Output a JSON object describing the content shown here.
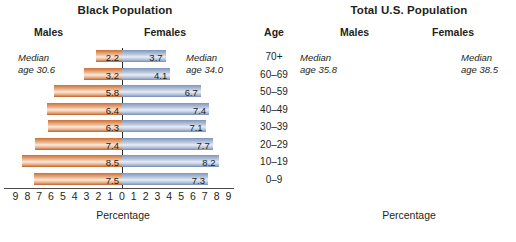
{
  "chart_data": {
    "type": "bar",
    "xlabel": "Percentage",
    "ylabel": "Age",
    "categories": [
      "70+",
      "60–69",
      "50–59",
      "40–49",
      "30–39",
      "20–29",
      "10–19",
      "0–9"
    ],
    "charts": [
      {
        "title": "Black Population",
        "xlabel": "Percentage",
        "xlim": [
          -9,
          9
        ],
        "xticks": [
          "9",
          "8",
          "7",
          "6",
          "5",
          "4",
          "3",
          "2",
          "1",
          "0",
          "1",
          "2",
          "3",
          "4",
          "5",
          "6",
          "7",
          "8",
          "9"
        ],
        "male_label": "Males",
        "female_label": "Females",
        "median_male": "30.6",
        "median_female": "34.0",
        "series": [
          {
            "name": "Males",
            "values": [
              2.2,
              3.2,
              5.8,
              6.4,
              6.3,
              7.4,
              8.5,
              7.5
            ]
          },
          {
            "name": "Females",
            "values": [
              3.7,
              4.1,
              6.7,
              7.4,
              7.1,
              7.7,
              8.2,
              7.3
            ]
          }
        ]
      },
      {
        "title": "Total U.S. Population",
        "xlabel": "Percentage",
        "xlim": [
          -8,
          8
        ],
        "xticks": [
          "8",
          "7",
          "6",
          "5",
          "4",
          "3",
          "2",
          "1",
          "0",
          "1",
          "2",
          "3",
          "4",
          "5",
          "6",
          "7",
          "8"
        ],
        "male_label": "Males",
        "female_label": "Females",
        "median_male": "35.8",
        "median_female": "38.5",
        "series": [
          {
            "name": "Males",
            "values": [
              2.7,
              4.5,
              6.6,
              7.0,
              6.5,
              7.0,
              7.1,
              6.7
            ]
          },
          {
            "name": "Females",
            "values": [
              5.3,
              4.9,
              6.9,
              7.1,
              6.5,
              6.8,
              6.7,
              6.4
            ]
          }
        ]
      }
    ],
    "colors": {
      "male": "#e08a52",
      "female": "#9fb2cf",
      "axis": "#2b2b2b",
      "text": "#231f20"
    },
    "grid": false,
    "legend": "none"
  },
  "black": {
    "title": "Black Population",
    "males_label": "Males",
    "females_label": "Females",
    "median_male_line1": "Median",
    "median_male_line2": "age 30.6",
    "median_female_line1": "Median",
    "median_female_line2": "age 34.0",
    "xcaption": "Percentage",
    "values_male": [
      "2.2",
      "3.2",
      "5.8",
      "6.4",
      "6.3",
      "7.4",
      "8.5",
      "7.5"
    ],
    "values_female": [
      "3.7",
      "4.1",
      "6.7",
      "7.4",
      "7.1",
      "7.7",
      "8.2",
      "7.3"
    ],
    "xticks": [
      "9",
      "8",
      "7",
      "6",
      "5",
      "4",
      "3",
      "2",
      "1",
      "0",
      "1",
      "2",
      "3",
      "4",
      "5",
      "6",
      "7",
      "8",
      "9"
    ]
  },
  "total": {
    "title": "Total U.S. Population",
    "males_label": "Males",
    "females_label": "Females",
    "median_male_line1": "Median",
    "median_male_line2": "age 35.8",
    "median_female_line1": "Median",
    "median_female_line2": "age 38.5",
    "xcaption": "Percentage",
    "values_male": [
      "2.7",
      "4.5",
      "6.6",
      "7.0",
      "6.5",
      "7.0",
      "7.1",
      "6.7"
    ],
    "values_female": [
      "5.3",
      "4.9",
      "6.9",
      "7.1",
      "6.5",
      "6.8",
      "6.7",
      "6.4"
    ],
    "xticks": [
      "8",
      "7",
      "6",
      "5",
      "4",
      "3",
      "2",
      "1",
      "0",
      "1",
      "2",
      "3",
      "4",
      "5",
      "6",
      "7",
      "8"
    ]
  },
  "age": {
    "heading": "Age",
    "groups": [
      "70+",
      "60–69",
      "50–59",
      "40–49",
      "30–39",
      "20–29",
      "10–19",
      "0–9"
    ]
  }
}
